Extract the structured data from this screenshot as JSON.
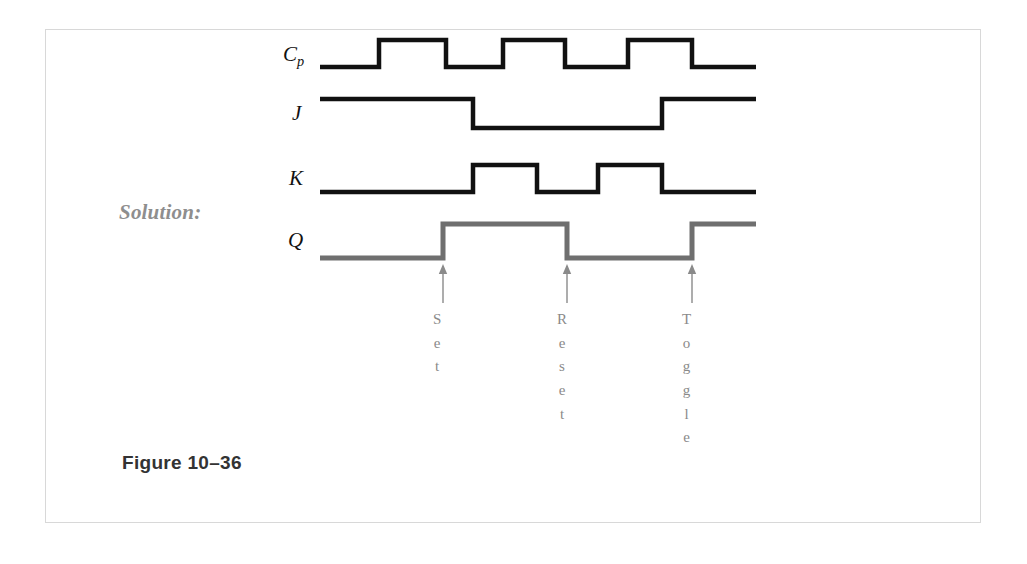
{
  "page": {
    "solution_label": "Solution:",
    "figure_caption": "Figure 10–36"
  },
  "colors": {
    "signal_black": "#111111",
    "signal_gray": "#6f6f6f",
    "annotation_gray": "#8a8a8a",
    "label_gray": "#8e8e8e",
    "caption": "#333333",
    "page_border": "#d8d8d8",
    "background": "#ffffff"
  },
  "signals": [
    {
      "name": "Cp",
      "base": "C",
      "sub": "p",
      "color": "#111111"
    },
    {
      "name": "J",
      "base": "J",
      "sub": "",
      "color": "#111111"
    },
    {
      "name": "K",
      "base": "K",
      "sub": "",
      "color": "#111111"
    },
    {
      "name": "Q",
      "base": "Q",
      "sub": "",
      "color": "#6f6f6f"
    }
  ],
  "annotations": [
    {
      "label": "Set",
      "letters": [
        "S",
        "e",
        "t"
      ],
      "x": 443
    },
    {
      "label": "Reset",
      "letters": [
        "R",
        "e",
        "s",
        "e",
        "t"
      ],
      "x": 567
    },
    {
      "label": "Toggle",
      "letters": [
        "T",
        "o",
        "g",
        "g",
        "l",
        "e"
      ],
      "x": 692
    }
  ],
  "chart_data": {
    "type": "line",
    "subtitle": "JK flip-flop timing diagram (Solution)",
    "xlabel": "",
    "ylabel": "",
    "x_start": 320,
    "x_end": 756,
    "grid": false,
    "legend": "none",
    "series": [
      {
        "name": "Cp",
        "color": "#111111",
        "high_y": 40,
        "low_y": 67,
        "description": "Clock pulse: three positive pulses",
        "levels": [
          {
            "x": 320,
            "level": 0
          },
          {
            "x": 379,
            "level": 1
          },
          {
            "x": 446,
            "level": 0
          },
          {
            "x": 503,
            "level": 1
          },
          {
            "x": 565,
            "level": 0
          },
          {
            "x": 628,
            "level": 1
          },
          {
            "x": 692,
            "level": 0
          },
          {
            "x": 756,
            "level": 0
          }
        ]
      },
      {
        "name": "J",
        "color": "#111111",
        "high_y": 99,
        "low_y": 128,
        "description": "J input: high, low during middle, high again",
        "levels": [
          {
            "x": 320,
            "level": 1
          },
          {
            "x": 473,
            "level": 0
          },
          {
            "x": 662,
            "level": 1
          },
          {
            "x": 756,
            "level": 1
          }
        ]
      },
      {
        "name": "K",
        "color": "#111111",
        "high_y": 165,
        "low_y": 192,
        "description": "K input: low, two positive pulses, low",
        "levels": [
          {
            "x": 320,
            "level": 0
          },
          {
            "x": 473,
            "level": 1
          },
          {
            "x": 537,
            "level": 0
          },
          {
            "x": 598,
            "level": 1
          },
          {
            "x": 662,
            "level": 0
          },
          {
            "x": 756,
            "level": 0
          }
        ]
      },
      {
        "name": "Q",
        "color": "#6f6f6f",
        "high_y": 224,
        "low_y": 258,
        "description": "Q output: set, reset, toggle on successive clock edges",
        "levels": [
          {
            "x": 320,
            "level": 0
          },
          {
            "x": 443,
            "level": 1
          },
          {
            "x": 567,
            "level": 0
          },
          {
            "x": 692,
            "level": 1
          },
          {
            "x": 756,
            "level": 1
          }
        ]
      }
    ],
    "annotations": [
      {
        "text": "Set",
        "x": 443,
        "points_to": "Q rising edge"
      },
      {
        "text": "Reset",
        "x": 567,
        "points_to": "Q falling edge"
      },
      {
        "text": "Toggle",
        "x": 692,
        "points_to": "Q rising edge"
      }
    ]
  }
}
